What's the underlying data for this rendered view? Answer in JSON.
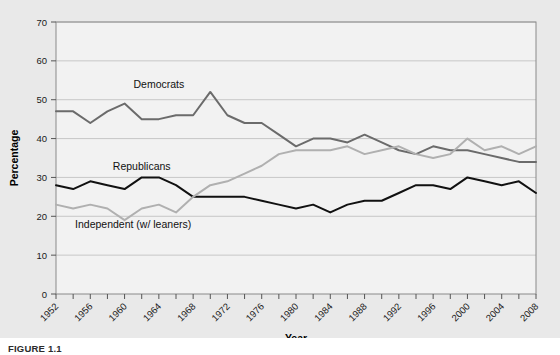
{
  "figure": {
    "caption": "FIGURE 1.1",
    "background": "#e9e9e9",
    "plot_background": "#f2f2f2"
  },
  "chart_data": {
    "type": "line",
    "title": "",
    "xlabel": "Year",
    "ylabel": "Percentage",
    "ylim": [
      0,
      70
    ],
    "xlim": [
      1952,
      2008
    ],
    "ytick_step": 10,
    "yticks": [
      0,
      10,
      20,
      30,
      40,
      50,
      60,
      70
    ],
    "xticks": [
      1952,
      1954,
      1956,
      1958,
      1960,
      1962,
      1964,
      1966,
      1968,
      1970,
      1972,
      1974,
      1976,
      1978,
      1980,
      1982,
      1984,
      1986,
      1988,
      1990,
      1992,
      1994,
      1996,
      1998,
      2000,
      2002,
      2004,
      2006,
      2008
    ],
    "xtick_labels": [
      "1952",
      "",
      "1956",
      "",
      "1960",
      "",
      "1964",
      "",
      "1968",
      "",
      "1972",
      "",
      "1976",
      "",
      "1980",
      "",
      "1984",
      "",
      "1988",
      "",
      "1992",
      "",
      "1996",
      "",
      "2000",
      "",
      "2004",
      "",
      "2008"
    ],
    "xtick_label_rotation": -45,
    "grid": "horizontal",
    "legend": "inline-labels",
    "x": [
      1952,
      1954,
      1956,
      1958,
      1960,
      1962,
      1964,
      1966,
      1968,
      1970,
      1972,
      1974,
      1976,
      1978,
      1980,
      1982,
      1984,
      1986,
      1988,
      1990,
      1992,
      1994,
      1996,
      1998,
      2000,
      2002,
      2004,
      2006,
      2008
    ],
    "series": [
      {
        "name": "Democrats",
        "color": "#6b6b6b",
        "label_x": 1964,
        "label_y": 53,
        "values": [
          47,
          47,
          44,
          47,
          49,
          45,
          45,
          46,
          46,
          52,
          46,
          44,
          44,
          41,
          38,
          40,
          40,
          39,
          41,
          39,
          37,
          36,
          38,
          37,
          37,
          36,
          35,
          34,
          34
        ]
      },
      {
        "name": "Republicans",
        "color": "#111111",
        "label_x": 1962,
        "label_y": 32,
        "values": [
          28,
          27,
          29,
          28,
          27,
          30,
          30,
          28,
          25,
          25,
          25,
          25,
          24,
          23,
          22,
          23,
          21,
          23,
          24,
          24,
          26,
          28,
          28,
          27,
          30,
          29,
          28,
          29,
          26
        ]
      },
      {
        "name": "Independent (w/ leaners)",
        "color": "#b0b0b0",
        "label_x": 1961,
        "label_y": 17,
        "values": [
          23,
          22,
          23,
          22,
          19,
          22,
          23,
          21,
          25,
          28,
          29,
          31,
          33,
          36,
          37,
          37,
          37,
          38,
          36,
          37,
          38,
          36,
          35,
          36,
          40,
          37,
          38,
          36,
          38
        ]
      }
    ]
  }
}
